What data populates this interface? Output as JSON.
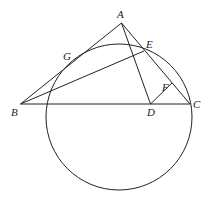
{
  "diagram": {
    "type": "geometry",
    "stroke_color": "#222222",
    "background": "#ffffff",
    "points": {
      "A": {
        "label": "A",
        "x": 121.5,
        "y": 23
      },
      "B": {
        "label": "B",
        "x": 20.5,
        "y": 104
      },
      "C": {
        "label": "C",
        "x": 190,
        "y": 104
      },
      "D": {
        "label": "D",
        "x": 150.5,
        "y": 104
      },
      "E": {
        "label": "E",
        "x": 144,
        "y": 51
      },
      "F": {
        "label": "F",
        "x": 172,
        "y": 83
      },
      "G": {
        "label": "G",
        "x": 77,
        "y": 59
      }
    },
    "labels": {
      "A": {
        "text": "A",
        "x": 117,
        "y": 18
      },
      "B": {
        "text": "B",
        "x": 11,
        "y": 116
      },
      "C": {
        "text": "C",
        "x": 193,
        "y": 108
      },
      "D": {
        "text": "D",
        "x": 147,
        "y": 116
      },
      "E": {
        "text": "E",
        "x": 146,
        "y": 48
      },
      "F": {
        "text": "F",
        "x": 162,
        "y": 91
      },
      "G": {
        "text": "G",
        "x": 63,
        "y": 60
      }
    },
    "circle": {
      "cx": 119,
      "cy": 117,
      "r": 73
    },
    "segments": [
      {
        "from": "A",
        "to": "B"
      },
      {
        "from": "A",
        "to": "C"
      },
      {
        "from": "A",
        "to": "D"
      },
      {
        "from": "B",
        "to": "C"
      },
      {
        "from": "B",
        "to": "E"
      },
      {
        "from": "D",
        "to": "F"
      }
    ]
  }
}
